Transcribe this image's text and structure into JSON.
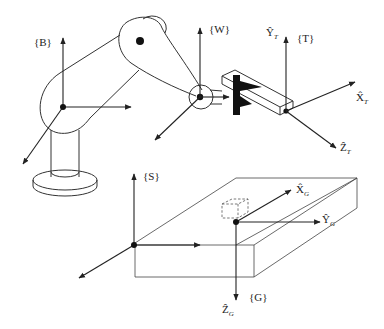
{
  "diagram": {
    "frames": [
      {
        "id": "B",
        "label": "{B}",
        "name": "base frame"
      },
      {
        "id": "W",
        "label": "{W}",
        "name": "wrist frame"
      },
      {
        "id": "T",
        "label": "{T}",
        "name": "tool frame"
      },
      {
        "id": "S",
        "label": "{S}",
        "name": "station frame"
      },
      {
        "id": "G",
        "label": "{G}",
        "name": "goal frame"
      }
    ],
    "axis_labels": {
      "tool_y": {
        "base": "Ŷ",
        "sub": "T"
      },
      "tool_x": {
        "base": "X̂",
        "sub": "T"
      },
      "tool_z": {
        "base": "Ẑ",
        "sub": "T"
      },
      "goal_x": {
        "base": "X̂",
        "sub": "G"
      },
      "goal_y": {
        "base": "Ŷ",
        "sub": "G"
      },
      "goal_z": {
        "base": "Ẑ",
        "sub": "G"
      }
    },
    "colors": {
      "line": "#333333",
      "fill_dark": "#111111",
      "background": "#ffffff"
    }
  }
}
